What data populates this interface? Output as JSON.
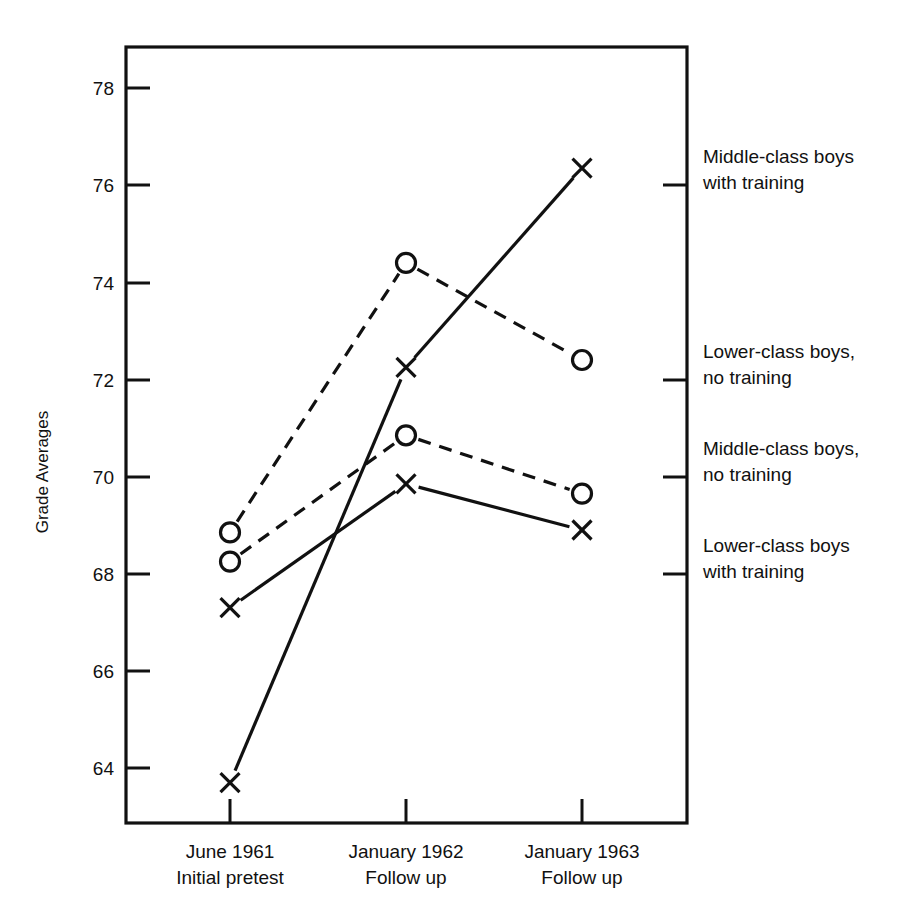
{
  "chart_data": {
    "type": "line",
    "title": "",
    "xlabel": "",
    "ylabel": "Grade Averages",
    "ylim": [
      63.0,
      79.0
    ],
    "grid": false,
    "legend_position": "right-of-plot",
    "categories": [
      "June 1961\nInitial pretest",
      "January 1962\nFollow up",
      "January 1963\nFollow up"
    ],
    "category_lines": [
      {
        "line1": "June 1961",
        "line2": "Initial pretest"
      },
      {
        "line1": "January 1962",
        "line2": "Follow up"
      },
      {
        "line1": "January 1963",
        "line2": "Follow up"
      }
    ],
    "ytick_labels": [
      "64",
      "66",
      "68",
      "70",
      "72",
      "74",
      "76",
      "78"
    ],
    "yticks": [
      64,
      66,
      68,
      70,
      72,
      74,
      76,
      78
    ],
    "series": [
      {
        "name": "Middle-class boys with training",
        "marker": "x",
        "linestyle": "solid",
        "values": [
          63.7,
          72.25,
          76.35
        ]
      },
      {
        "name": "Lower-class boys, no training",
        "marker": "circle",
        "linestyle": "dashed",
        "values": [
          68.85,
          74.4,
          72.4
        ]
      },
      {
        "name": "Middle-class boys, no training",
        "marker": "circle",
        "linestyle": "dashed",
        "values": [
          68.25,
          70.85,
          69.65
        ]
      },
      {
        "name": "Lower-class boys with training",
        "marker": "x",
        "linestyle": "solid",
        "values": [
          67.3,
          69.85,
          68.9
        ]
      }
    ]
  },
  "legend": {
    "entries": [
      {
        "line1": "Middle-class boys",
        "line2": "with training"
      },
      {
        "line1": "Lower-class boys,",
        "line2": "no training"
      },
      {
        "line1": "Middle-class boys,",
        "line2": "no training"
      },
      {
        "line1": "Lower-class boys",
        "line2": "with training"
      }
    ]
  },
  "colors": {
    "ink": "#111111",
    "paper": "#ffffff"
  }
}
